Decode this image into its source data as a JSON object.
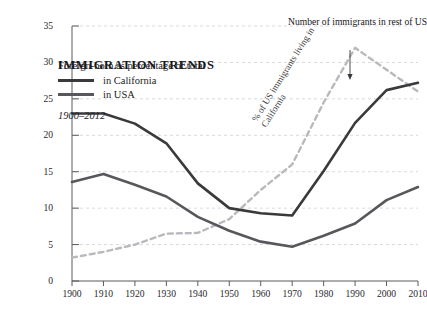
{
  "title": "IMMIGRATION TRENDS",
  "subtitle": "1900–2012",
  "legend": {
    "header": "Foreign-born as percentage of total",
    "items": [
      {
        "label": "in California",
        "color": "#3a3a3c",
        "style": "solid"
      },
      {
        "label": "in USA",
        "color": "#58585c",
        "style": "solid"
      }
    ]
  },
  "annotations": [
    {
      "name": "outpacing-note",
      "text": "Number of immigrants in rest of US outpacing those in California"
    },
    {
      "name": "dashed-series-label",
      "text": "% of US immigrants living in California"
    }
  ],
  "chart_data": {
    "type": "line",
    "title": "IMMIGRATION TRENDS",
    "subtitle": "1900–2012",
    "xlabel": "",
    "ylabel": "",
    "xlim": [
      1900,
      2010
    ],
    "ylim": [
      0,
      35
    ],
    "yticks": [
      0,
      5,
      10,
      15,
      20,
      25,
      30,
      35
    ],
    "xticks": [
      1900,
      1910,
      1920,
      1930,
      1940,
      1950,
      1960,
      1970,
      1980,
      1990,
      2000,
      2010
    ],
    "grid": "horizontal-dashed",
    "legend_position": "top-left",
    "x": [
      1900,
      1910,
      1920,
      1930,
      1940,
      1950,
      1960,
      1970,
      1980,
      1990,
      2000,
      2010
    ],
    "series": [
      {
        "name": "in California",
        "color": "#3a3a3c",
        "style": "solid",
        "values": [
          23.0,
          23.0,
          21.6,
          18.9,
          13.4,
          10.0,
          9.3,
          9.0,
          15.1,
          21.7,
          26.2,
          27.2
        ]
      },
      {
        "name": "in USA",
        "color": "#58585c",
        "style": "solid",
        "values": [
          13.6,
          14.7,
          13.2,
          11.6,
          8.8,
          6.9,
          5.4,
          4.7,
          6.2,
          7.9,
          11.1,
          12.9
        ]
      },
      {
        "name": "% of US immigrants living in California",
        "color": "#b9b9bd",
        "style": "dashed",
        "values": [
          3.2,
          4.0,
          5.0,
          6.5,
          6.6,
          8.5,
          12.5,
          16.0,
          24.5,
          32.0,
          29.0,
          26.0
        ]
      }
    ]
  }
}
